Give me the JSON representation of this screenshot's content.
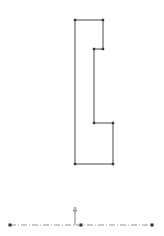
{
  "sketch": {
    "profile_points": [
      [
        75,
        20
      ],
      [
        103,
        20
      ],
      [
        103,
        49
      ],
      [
        94,
        49
      ],
      [
        94,
        123
      ],
      [
        113,
        123
      ],
      [
        113,
        164
      ],
      [
        75,
        164
      ]
    ],
    "profile_color": "#4a4a4a",
    "vertex_color": "#333333",
    "centerline": {
      "x1": 10,
      "y1": 225,
      "x2": 152,
      "y2": 225,
      "mid_x": 81,
      "color": "#777777"
    },
    "origin_arrow": {
      "x": 75,
      "y_from": 225,
      "y_to": 207,
      "color": "#666666"
    }
  }
}
